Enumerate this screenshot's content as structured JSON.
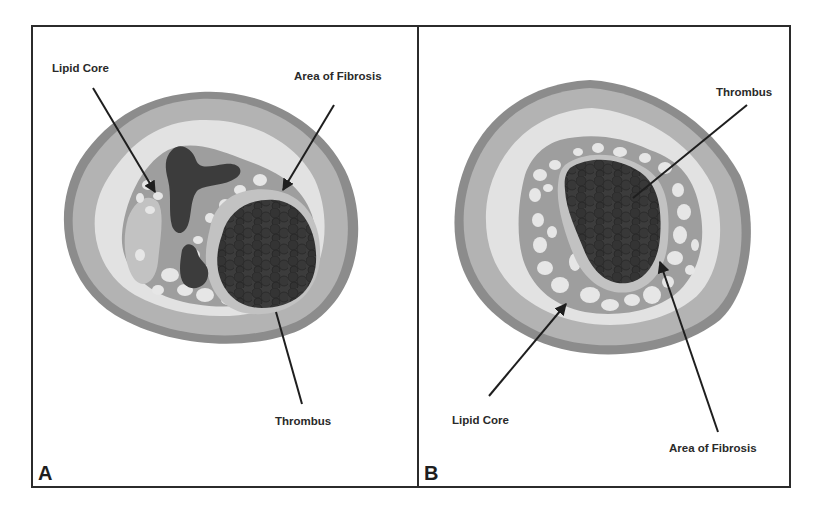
{
  "figure": {
    "panels": [
      {
        "letter": "A",
        "labels": {
          "lipid_core": "Lipid Core",
          "fibrosis": "Area of Fibrosis",
          "thrombus": "Thrombus"
        }
      },
      {
        "letter": "B",
        "labels": {
          "thrombus": "Thrombus",
          "lipid_core": "Lipid Core",
          "fibrosis": "Area of Fibrosis"
        }
      }
    ],
    "colors": {
      "frame": "#2b2b2b",
      "adventitia": "#8c8c8c",
      "media": "#b3b3b3",
      "intima": "#e2e2e2",
      "plaque_matrix": "#9e9e9e",
      "lipid_globule": "#e6e6e6",
      "fibrous_cap": "#c2c2c2",
      "lumen_blood": "#3c3c3c",
      "thrombus_cells": "#2c2c2c",
      "arrow": "#1e1e1e"
    }
  }
}
